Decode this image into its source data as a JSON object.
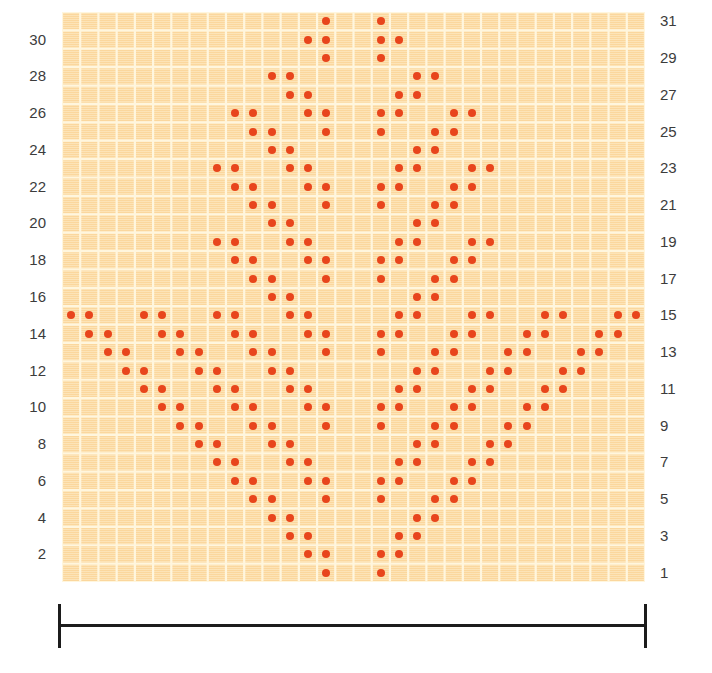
{
  "chart_data": {
    "type": "heatmap",
    "title": "",
    "subtitle": "",
    "xlabel": "",
    "ylabel": "",
    "grid": true,
    "legend_position": "none",
    "columns": 32,
    "rows": 31,
    "xlim": [
      1,
      32
    ],
    "ylim": [
      1,
      31
    ],
    "row_numbering_direction": "bottom-to-top",
    "cell_colors": {
      "background": "#fbd79b",
      "gridline": "#fff6de",
      "symbol": "#e8451c"
    },
    "symbol": "dot",
    "marked_cells": [
      {
        "row": 31,
        "cols": [
          15,
          18
        ]
      },
      {
        "row": 30,
        "cols": [
          14,
          15,
          18,
          19
        ]
      },
      {
        "row": 29,
        "cols": [
          15,
          18
        ]
      },
      {
        "row": 28,
        "cols": [
          12,
          13,
          20,
          21
        ]
      },
      {
        "row": 27,
        "cols": [
          13,
          14,
          19,
          20
        ]
      },
      {
        "row": 26,
        "cols": [
          10,
          11,
          14,
          15,
          18,
          19,
          22,
          23
        ]
      },
      {
        "row": 25,
        "cols": [
          11,
          12,
          15,
          18,
          21,
          22
        ]
      },
      {
        "row": 24,
        "cols": [
          12,
          13,
          20,
          21
        ]
      },
      {
        "row": 23,
        "cols": [
          9,
          10,
          13,
          14,
          19,
          20,
          23,
          24
        ]
      },
      {
        "row": 22,
        "cols": [
          10,
          11,
          14,
          15,
          18,
          19,
          22,
          23
        ]
      },
      {
        "row": 21,
        "cols": [
          11,
          12,
          15,
          18,
          21,
          22
        ]
      },
      {
        "row": 20,
        "cols": [
          12,
          13,
          20,
          21
        ]
      },
      {
        "row": 19,
        "cols": [
          9,
          10,
          13,
          14,
          19,
          20,
          23,
          24
        ]
      },
      {
        "row": 18,
        "cols": [
          10,
          11,
          14,
          15,
          18,
          19,
          22,
          23
        ]
      },
      {
        "row": 17,
        "cols": [
          11,
          12,
          15,
          18,
          21,
          22
        ]
      },
      {
        "row": 16,
        "cols": [
          12,
          13,
          20,
          21
        ]
      },
      {
        "row": 15,
        "cols": [
          1,
          2,
          5,
          6,
          9,
          10,
          13,
          14,
          19,
          20,
          23,
          24,
          27,
          28,
          31,
          32
        ]
      },
      {
        "row": 14,
        "cols": [
          2,
          3,
          6,
          7,
          10,
          11,
          14,
          15,
          18,
          19,
          22,
          23,
          26,
          27,
          30,
          31
        ]
      },
      {
        "row": 13,
        "cols": [
          3,
          4,
          7,
          8,
          11,
          12,
          15,
          18,
          21,
          22,
          25,
          26,
          29,
          30
        ]
      },
      {
        "row": 12,
        "cols": [
          4,
          5,
          8,
          9,
          12,
          13,
          20,
          21,
          24,
          25,
          28,
          29
        ]
      },
      {
        "row": 11,
        "cols": [
          5,
          6,
          9,
          10,
          13,
          14,
          19,
          20,
          23,
          24,
          27,
          28
        ]
      },
      {
        "row": 10,
        "cols": [
          6,
          7,
          10,
          11,
          14,
          15,
          18,
          19,
          22,
          23,
          26,
          27
        ]
      },
      {
        "row": 9,
        "cols": [
          7,
          8,
          11,
          12,
          15,
          18,
          21,
          22,
          25,
          26
        ]
      },
      {
        "row": 8,
        "cols": [
          8,
          9,
          12,
          13,
          20,
          21,
          24,
          25
        ]
      },
      {
        "row": 7,
        "cols": [
          9,
          10,
          13,
          14,
          19,
          20,
          23,
          24
        ]
      },
      {
        "row": 6,
        "cols": [
          10,
          11,
          14,
          15,
          18,
          19,
          22,
          23
        ]
      },
      {
        "row": 5,
        "cols": [
          11,
          12,
          15,
          18,
          21,
          22
        ]
      },
      {
        "row": 4,
        "cols": [
          12,
          13,
          20,
          21
        ]
      },
      {
        "row": 3,
        "cols": [
          13,
          14,
          19,
          20
        ]
      },
      {
        "row": 2,
        "cols": [
          14,
          15,
          18,
          19
        ]
      },
      {
        "row": 1,
        "cols": [
          15,
          18
        ]
      }
    ]
  },
  "axis": {
    "left_labels": [
      "30",
      "28",
      "26",
      "24",
      "22",
      "20",
      "18",
      "16",
      "14",
      "12",
      "10",
      "8",
      "6",
      "4",
      "2"
    ],
    "left_label_rows": [
      30,
      28,
      26,
      24,
      22,
      20,
      18,
      16,
      14,
      12,
      10,
      8,
      6,
      4,
      2
    ],
    "right_labels": [
      "31",
      "29",
      "27",
      "25",
      "23",
      "21",
      "19",
      "17",
      "15",
      "13",
      "11",
      "9",
      "7",
      "5",
      "3",
      "1"
    ],
    "right_label_rows": [
      31,
      29,
      27,
      25,
      23,
      21,
      19,
      17,
      15,
      13,
      11,
      9,
      7,
      5,
      3,
      1
    ]
  },
  "width_bar": {
    "label": "",
    "color": "#1c1c1c"
  }
}
